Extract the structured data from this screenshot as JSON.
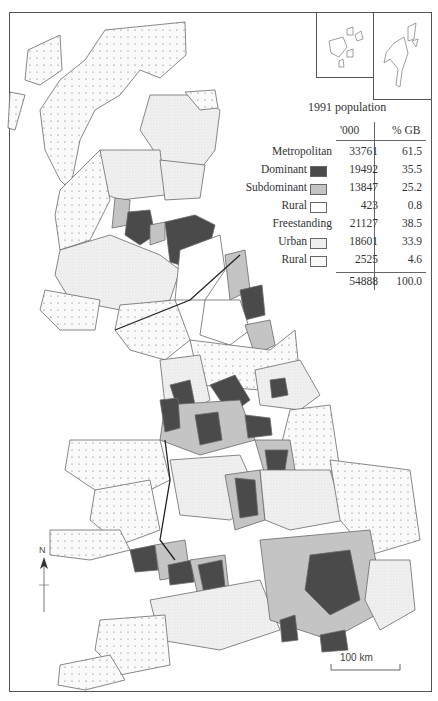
{
  "map": {
    "subject": "Great Britain metropolitan and freestanding areas, 1991 population",
    "legend": {
      "title": "1991 population",
      "col_headers": [
        "'000",
        "% GB"
      ],
      "rows": [
        {
          "label": "Metropolitan",
          "thousands": "33761",
          "pct": "61.5",
          "swatch": null
        },
        {
          "label": "Dominant",
          "thousands": "19492",
          "pct": "35.5",
          "swatch": "dominant"
        },
        {
          "label": "Subdominant",
          "thousands": "13847",
          "pct": "25.2",
          "swatch": "subdominant"
        },
        {
          "label": "Rural",
          "thousands": "423",
          "pct": "0.8",
          "swatch": "metro-rural"
        },
        {
          "label": "Freestanding",
          "thousands": "21127",
          "pct": "38.5",
          "swatch": null
        },
        {
          "label": "Urban",
          "thousands": "18601",
          "pct": "33.9",
          "swatch": "fs-urban"
        },
        {
          "label": "Rural",
          "thousands": "2525",
          "pct": "4.6",
          "swatch": "fs-rural"
        }
      ],
      "total": {
        "thousands": "54888",
        "pct": "100.0"
      }
    },
    "colors": {
      "dominant": "#4a4a4a",
      "subdominant": "#c4c4c4",
      "metro_rural": "#ffffff",
      "fs_urban": "#eeeeee",
      "fs_rural": "#f6f6f6",
      "outline": "#6a6a6a"
    },
    "scale_bar": {
      "label": "100 km"
    },
    "north_arrow": {
      "label": "N"
    },
    "insets": [
      "Orkney",
      "Shetland"
    ]
  }
}
